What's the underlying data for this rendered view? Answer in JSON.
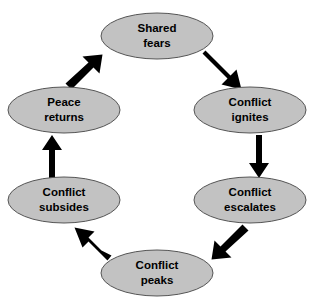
{
  "diagram": {
    "type": "cycle",
    "direction": "clockwise",
    "background_color": "#ffffff",
    "node_fill_color": "#c2c2c2",
    "node_border_color": "#555555",
    "label_color": "#000000",
    "arrow_color": "#000000",
    "nodes": [
      {
        "id": "shared-fears",
        "line1": "Shared",
        "line2": "fears",
        "cx": 157,
        "cy": 36,
        "rx": 56,
        "ry": 23
      },
      {
        "id": "conflict-ignites",
        "line1": "Conflict",
        "line2": "ignites",
        "cx": 250,
        "cy": 110,
        "rx": 56,
        "ry": 23
      },
      {
        "id": "conflict-escalates",
        "line1": "Conflict",
        "line2": "escalates",
        "cx": 250,
        "cy": 200,
        "rx": 56,
        "ry": 23
      },
      {
        "id": "conflict-peaks",
        "line1": "Conflict",
        "line2": "peaks",
        "cx": 157,
        "cy": 273,
        "rx": 56,
        "ry": 23
      },
      {
        "id": "conflict-subsides",
        "line1": "Conflict",
        "line2": "subsides",
        "cx": 64,
        "cy": 200,
        "rx": 56,
        "ry": 23
      },
      {
        "id": "peace-returns",
        "line1": "Peace",
        "line2": "returns",
        "cx": 64,
        "cy": 110,
        "rx": 56,
        "ry": 23
      }
    ],
    "arrows": [
      {
        "id": "shared-fears-to-conflict-ignites",
        "from": "shared-fears",
        "to": "conflict-ignites",
        "orientation": "diagonal-down-right"
      },
      {
        "id": "conflict-ignites-to-conflict-escalates",
        "from": "conflict-ignites",
        "to": "conflict-escalates",
        "orientation": "vertical-down"
      },
      {
        "id": "conflict-escalates-to-conflict-peaks",
        "from": "conflict-escalates",
        "to": "conflict-peaks",
        "orientation": "diagonal-down-left"
      },
      {
        "id": "conflict-peaks-to-conflict-subsides",
        "from": "conflict-peaks",
        "to": "conflict-subsides",
        "orientation": "diagonal-up-left"
      },
      {
        "id": "conflict-subsides-to-peace-returns",
        "from": "conflict-subsides",
        "to": "peace-returns",
        "orientation": "vertical-up"
      },
      {
        "id": "peace-returns-to-shared-fears",
        "from": "peace-returns",
        "to": "shared-fears",
        "orientation": "diagonal-up-right"
      }
    ]
  }
}
